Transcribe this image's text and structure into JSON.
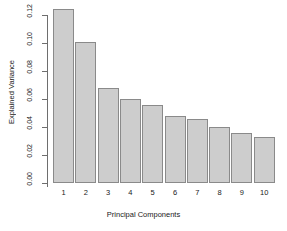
{
  "chart_data": {
    "type": "bar",
    "title": "",
    "xlabel": "Principal Components",
    "ylabel": "Explained Variance",
    "categories": [
      "1",
      "2",
      "3",
      "4",
      "5",
      "6",
      "7",
      "8",
      "9",
      "10"
    ],
    "values": [
      0.124,
      0.101,
      0.068,
      0.06,
      0.056,
      0.048,
      0.046,
      0.04,
      0.036,
      0.033
    ],
    "ylim": [
      0.0,
      0.13
    ],
    "yticks": [
      0.0,
      0.02,
      0.04,
      0.06,
      0.08,
      0.1,
      0.12
    ],
    "ytick_labels": [
      "0.00",
      "0.02",
      "0.04",
      "0.06",
      "0.08",
      "0.10",
      "0.12"
    ],
    "grid": false,
    "legend": null,
    "bar_fill_color": "#cdcdcd",
    "bar_border_color": "#8a8a8a",
    "axis_color": "#6e6e6e",
    "background_color": "#ffffff"
  }
}
